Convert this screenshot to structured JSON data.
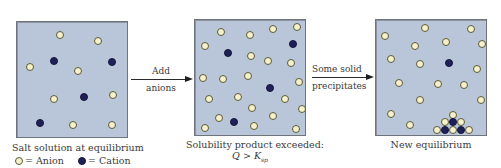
{
  "colors": {
    "panel_background": "#b9c5d9",
    "anion_fill": "#f4f1cc",
    "cation_fill": "#1f2058"
  },
  "panels": [
    {
      "caption": "Salt solution at equilibrium",
      "anions": [
        [
          43,
          13
        ],
        [
          81,
          19
        ],
        [
          13,
          45
        ],
        [
          61,
          49
        ],
        [
          37,
          77
        ],
        [
          96,
          73
        ],
        [
          56,
          103
        ],
        [
          95,
          103
        ]
      ],
      "cations": [
        [
          37,
          39
        ],
        [
          95,
          40
        ],
        [
          67,
          75
        ],
        [
          23,
          101
        ]
      ]
    },
    {
      "caption": "Solubility product exceeded:",
      "caption_line2": {
        "Q": "Q",
        "op": " > ",
        "K": "K",
        "sub": "sp"
      },
      "anions": [
        [
          26,
          12
        ],
        [
          55,
          15
        ],
        [
          78,
          9
        ],
        [
          102,
          7
        ],
        [
          10,
          26
        ],
        [
          56,
          36
        ],
        [
          73,
          41
        ],
        [
          96,
          43
        ],
        [
          8,
          58
        ],
        [
          28,
          59
        ],
        [
          53,
          56
        ],
        [
          104,
          62
        ],
        [
          14,
          79
        ],
        [
          43,
          77
        ],
        [
          90,
          79
        ],
        [
          57,
          88
        ],
        [
          107,
          89
        ],
        [
          24,
          98
        ],
        [
          78,
          96
        ],
        [
          10,
          108
        ],
        [
          59,
          106
        ],
        [
          101,
          109
        ]
      ],
      "cations": [
        [
          33,
          33
        ],
        [
          98,
          24
        ],
        [
          75,
          68
        ],
        [
          39,
          102
        ]
      ]
    },
    {
      "caption": "New equilibrium",
      "anions": [
        [
          49,
          8
        ],
        [
          95,
          9
        ],
        [
          9,
          16
        ],
        [
          39,
          26
        ],
        [
          70,
          22
        ],
        [
          106,
          24
        ],
        [
          15,
          39
        ],
        [
          44,
          44
        ],
        [
          101,
          49
        ],
        [
          23,
          63
        ],
        [
          62,
          64
        ],
        [
          88,
          65
        ],
        [
          44,
          80
        ],
        [
          105,
          80
        ],
        [
          15,
          94
        ],
        [
          34,
          105
        ],
        [
          77,
          95
        ],
        [
          69,
          102
        ],
        [
          85,
          102
        ],
        [
          61,
          110
        ],
        [
          77,
          110
        ],
        [
          93,
          110
        ]
      ],
      "cations": [
        [
          73,
          43
        ],
        [
          77,
          102
        ],
        [
          69,
          110
        ],
        [
          85,
          110
        ]
      ]
    }
  ],
  "arrows": [
    {
      "top_label": "Add",
      "bottom_label": "anions"
    },
    {
      "top_label": "Some solid",
      "bottom_label": "precipitates"
    }
  ],
  "legend": {
    "anion_label": "= Anion",
    "cation_label": "= Cation"
  }
}
